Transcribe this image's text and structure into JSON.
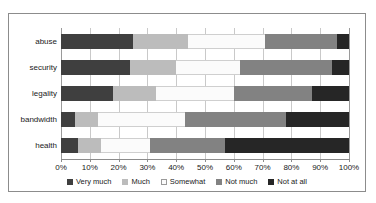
{
  "chart_data": {
    "type": "bar",
    "orientation": "horizontal",
    "stacked": true,
    "stack_mode": "percent",
    "title": "",
    "xlabel": "",
    "ylabel": "",
    "xlim": [
      0,
      100
    ],
    "grid": true,
    "legend_position": "bottom",
    "categories": [
      "abuse",
      "security",
      "legality",
      "bandwidth",
      "health"
    ],
    "tick_labels": [
      "0%",
      "10%",
      "20%",
      "30%",
      "40%",
      "50%",
      "60%",
      "70%",
      "80%",
      "90%",
      "100%"
    ],
    "tick_values": [
      0,
      10,
      20,
      30,
      40,
      50,
      60,
      70,
      80,
      90,
      100
    ],
    "series": [
      {
        "name": "Very much",
        "color": "#3f3f3f",
        "values": [
          25,
          24,
          18,
          5,
          6
        ]
      },
      {
        "name": "Much",
        "color": "#bcbcbc",
        "values": [
          19,
          16,
          15,
          8,
          8
        ]
      },
      {
        "name": "Somewhat",
        "color": "#fbfbfb",
        "values": [
          27,
          22,
          27,
          30,
          17
        ]
      },
      {
        "name": "Not much",
        "color": "#828282",
        "values": [
          25,
          32,
          27,
          35,
          26
        ]
      },
      {
        "name": "Not at all",
        "color": "#262626",
        "values": [
          4,
          6,
          13,
          22,
          43
        ]
      }
    ]
  },
  "legend": {
    "items": [
      {
        "label": "Very much"
      },
      {
        "label": "Much"
      },
      {
        "label": "Somewhat"
      },
      {
        "label": "Not much"
      },
      {
        "label": "Not at all"
      }
    ]
  }
}
